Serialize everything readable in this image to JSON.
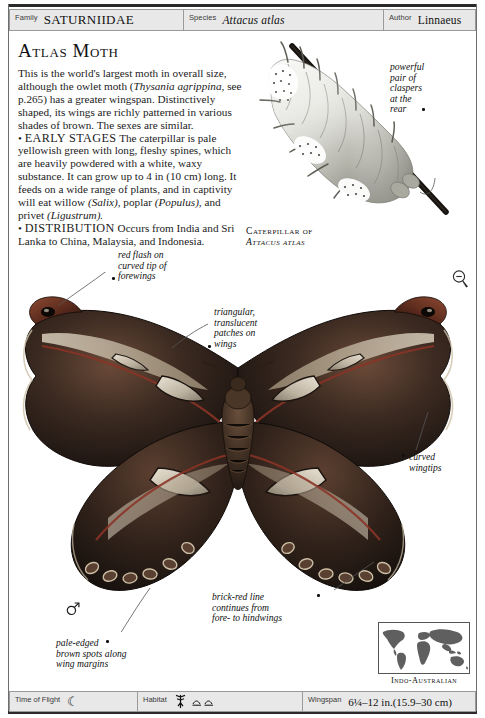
{
  "page": {
    "title": "Atlas Moth"
  },
  "header": {
    "family": {
      "label": "Family",
      "value": "SATURNIIDAE"
    },
    "species": {
      "label": "Species",
      "value": "Attacus atlas"
    },
    "author": {
      "label": "Author",
      "value": "Linnaeus"
    }
  },
  "article": {
    "heading": "Atlas Moth",
    "intro": "This is the world's largest moth in overall size, although the owlet moth (Thysania agrippina, see p.265) has a greater wingspan. Distinctively shaped, its wings are richly patterned in various shades of brown. The sexes are similar.",
    "intro_parts": {
      "a": "This is the world's largest moth in overall size, although the owlet moth (",
      "italic1": "Thysania agrippina,",
      "b": " see p.265) has a greater wingspan. Distinctively shaped, its wings are richly patterned in various shades of brown. The sexes are similar."
    },
    "early_stages": {
      "bullet": "•",
      "label": "EARLY STAGES",
      "text_a": " The caterpillar is pale yellowish green with long, fleshy spines, which are heavily powdered with a white, waxy substance. It can grow up to 4 in  (10 cm) long. It feeds on a wide range of plants, and in captivity will eat willow ",
      "italic1": "(Salix),",
      "text_b": " poplar ",
      "italic2": "(Populus),",
      "text_c": " and privet ",
      "italic3": "(Ligustrum)."
    },
    "distribution": {
      "bullet": "•",
      "label": "DISTRIBUTION",
      "text": " Occurs from India and Sri Lanka to China, Malaysia, and Indonesia."
    }
  },
  "caterpillar_figure": {
    "caption_line1": "Caterpillar of",
    "caption_line2": "Attacus atlas",
    "annotation": {
      "text": "powerful\npair of\nclaspers\nat the\nrear"
    }
  },
  "annotations": [
    {
      "name": "red-flash-forewings",
      "text": "red flash on\ncurved tip of\nforewings"
    },
    {
      "name": "translucent-patches",
      "text": "triangular,\ntranslucent\npatches on\nwings"
    },
    {
      "name": "curved-wingtips",
      "text": "curved\nwingtips"
    },
    {
      "name": "brick-red-line",
      "text": "brick-red line\ncontinues from\nfore- to hindwings"
    },
    {
      "name": "pale-edged-spots",
      "text": "pale-edged\nbrown spots along\nwing margins"
    }
  ],
  "icons": {
    "reduction": "magnifier-minus-icon",
    "sex": "male-symbol-icon",
    "time_of_flight": "☾",
    "habitat_tree": "ॐ",
    "habitat_scrub": "≈"
  },
  "map": {
    "label": "Indo-Australian"
  },
  "footer": {
    "time_of_flight": {
      "label": "Time of Flight",
      "value": ""
    },
    "habitat": {
      "label": "Habitat",
      "value": ""
    },
    "wingspan": {
      "label": "Wingspan",
      "value": "6¼–12 in.(15.9–30 cm)"
    }
  },
  "colors": {
    "paper": "#ffffff",
    "strip": "#e8e8e8",
    "rule": "#2b2b2b",
    "moth_dark": "#241a16",
    "moth_mid": "#4a342a",
    "moth_pale": "#c9bfae",
    "brick_red": "#8a3326"
  }
}
